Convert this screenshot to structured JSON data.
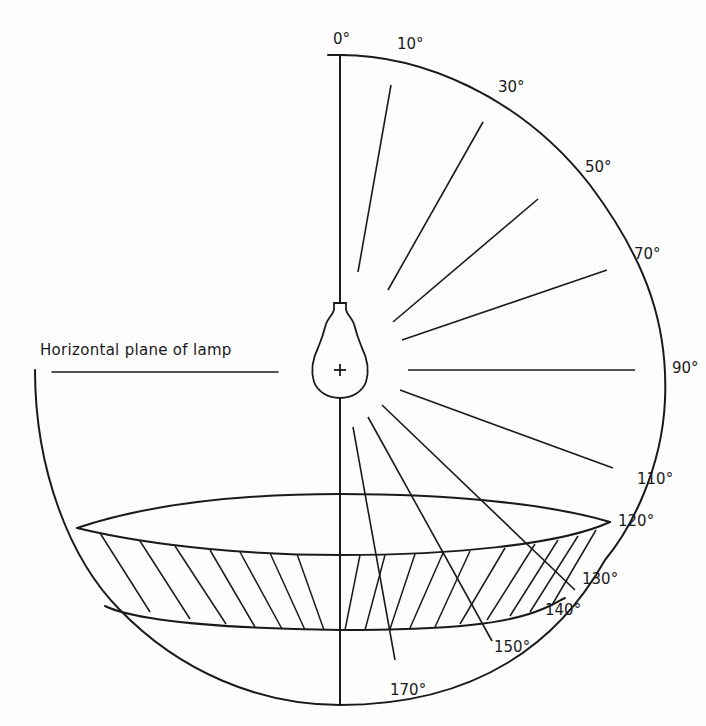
{
  "diagram": {
    "caption": "Horizontal plane of lamp",
    "lamp_symbol": "+",
    "angle_labels": [
      {
        "text": "0°",
        "x": 333,
        "y": 32
      },
      {
        "text": "10°",
        "x": 397,
        "y": 37
      },
      {
        "text": "30°",
        "x": 498,
        "y": 80
      },
      {
        "text": "50°",
        "x": 585,
        "y": 160
      },
      {
        "text": "70°",
        "x": 634,
        "y": 247
      },
      {
        "text": "90°",
        "x": 672,
        "y": 361
      },
      {
        "text": "110°",
        "x": 637,
        "y": 472
      },
      {
        "text": "120°",
        "x": 618,
        "y": 514
      },
      {
        "text": "130°",
        "x": 582,
        "y": 572
      },
      {
        "text": "140°",
        "x": 545,
        "y": 603
      },
      {
        "text": "150°",
        "x": 494,
        "y": 640
      },
      {
        "text": "170°",
        "x": 390,
        "y": 683
      }
    ],
    "rays": [
      {
        "angle": 10,
        "x1": 358,
        "y1": 272,
        "x2": 391,
        "y2": 85
      },
      {
        "angle": 30,
        "x1": 388,
        "y1": 290,
        "x2": 483,
        "y2": 122
      },
      {
        "angle": 50,
        "x1": 393,
        "y1": 322,
        "x2": 538,
        "y2": 199
      },
      {
        "angle": 70,
        "x1": 402,
        "y1": 340,
        "x2": 607,
        "y2": 270
      },
      {
        "angle": 90,
        "x1": 408,
        "y1": 370,
        "x2": 635,
        "y2": 370
      },
      {
        "angle": 110,
        "x1": 400,
        "y1": 390,
        "x2": 613,
        "y2": 468
      },
      {
        "angle": 130,
        "x1": 382,
        "y1": 405,
        "x2": 575,
        "y2": 590
      },
      {
        "angle": 150,
        "x1": 368,
        "y1": 417,
        "x2": 492,
        "y2": 641
      },
      {
        "angle": 170,
        "x1": 353,
        "y1": 427,
        "x2": 395,
        "y2": 660
      }
    ],
    "colors": {
      "ink": "#1a1a1a",
      "paper": "#fdfdfd"
    }
  }
}
